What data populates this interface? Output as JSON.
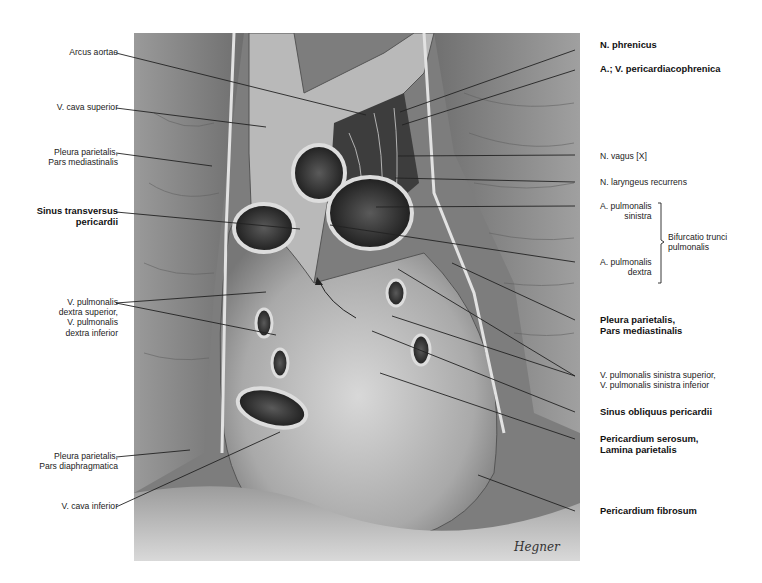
{
  "figure": {
    "signature": "Hegner"
  },
  "labels": {
    "left": [
      {
        "id": "arcus-aortae",
        "text": "Arcus aortae",
        "bold": false
      },
      {
        "id": "v-cava-superior",
        "text": "V. cava superior",
        "bold": false
      },
      {
        "id": "pleura-pars-mediastinalis-left",
        "text": "Pleura parietalis,\nPars mediastinalis",
        "bold": false
      },
      {
        "id": "sinus-transversus",
        "text": "Sinus transversus\npericardii",
        "bold": true
      },
      {
        "id": "v-pulmonalis-dextra",
        "text": "V. pulmonalis\ndextra superior,\nV. pulmonalis\ndextra inferior",
        "bold": false
      },
      {
        "id": "pleura-pars-diaphragmatica",
        "text": "Pleura parietalis,\nPars diaphragmatica",
        "bold": false
      },
      {
        "id": "v-cava-inferior",
        "text": "V. cava inferior",
        "bold": false
      }
    ],
    "right": [
      {
        "id": "n-phrenicus",
        "text": "N. phrenicus",
        "bold": true
      },
      {
        "id": "a-v-pericardiacophrenica",
        "text": "A.; V. pericardiacophrenica",
        "bold": true
      },
      {
        "id": "n-vagus",
        "text": "N. vagus [X]",
        "bold": false
      },
      {
        "id": "n-laryngeus-recurrens",
        "text": "N. laryngeus recurrens",
        "bold": false
      },
      {
        "id": "a-pulmonalis-sinistra",
        "text": "A. pulmonalis\nsinistra",
        "bold": false
      },
      {
        "id": "a-pulmonalis-dextra",
        "text": "A. pulmonalis\ndextra",
        "bold": false
      },
      {
        "id": "pleura-pars-mediastinalis-right",
        "text": "Pleura parietalis,\nPars mediastinalis",
        "bold": true
      },
      {
        "id": "v-pulmonalis-sinistra",
        "text": "V. pulmonalis sinistra superior,\nV. pulmonalis sinistra inferior",
        "bold": false
      },
      {
        "id": "sinus-obliquus",
        "text": "Sinus obliquus pericardii",
        "bold": true
      },
      {
        "id": "pericardium-serosum",
        "text": "Pericardium serosum,\nLamina parietalis",
        "bold": true
      },
      {
        "id": "pericardium-fibrosum",
        "text": "Pericardium fibrosum",
        "bold": true
      }
    ],
    "brace": {
      "text": "Bifurcatio trunci\npulmonalis"
    }
  }
}
